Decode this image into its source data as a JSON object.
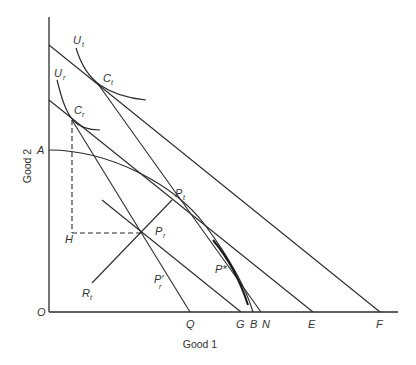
{
  "diagram": {
    "x_axis_label": "Good 1",
    "y_axis_label": "Good 2",
    "origin_label": "O",
    "axis_labels": {
      "A": "A",
      "Q": "Q",
      "G": "G",
      "B": "B",
      "N": "N",
      "E": "E",
      "F": "F",
      "H": "H"
    },
    "points": {
      "Ct": {
        "main": "C",
        "sub": "t"
      },
      "Cr": {
        "main": "C",
        "sub": "r"
      },
      "Pt": {
        "main": "P",
        "sub": "t"
      },
      "Pr": {
        "main": "P",
        "sub": "r"
      },
      "Pr_prime": {
        "main": "P'",
        "sub": "r"
      },
      "Pstar": {
        "main": "P*"
      },
      "Rt": {
        "main": "R",
        "sub": "t"
      }
    },
    "curves": {
      "Ut": {
        "main": "U",
        "sub": "t"
      },
      "Ur": {
        "main": "U",
        "sub": "r"
      }
    }
  }
}
